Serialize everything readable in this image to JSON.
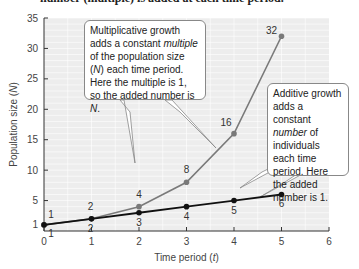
{
  "caption": "number (multiple) is added at each time period.",
  "chart_data": {
    "type": "line",
    "title": "",
    "xlabel": "Time period (t)",
    "ylabel": "Population size (N)",
    "xlim": [
      0,
      6
    ],
    "ylim": [
      0,
      35
    ],
    "x_ticks": [
      0,
      1,
      2,
      3,
      4,
      5,
      6
    ],
    "y_ticks": [
      1,
      5,
      10,
      15,
      20,
      25,
      30,
      35
    ],
    "grid": true,
    "series": [
      {
        "name": "Multiplicative growth",
        "color": "#7a7a7a",
        "x": [
          0,
          1,
          2,
          3,
          4,
          5
        ],
        "values": [
          1,
          2,
          4,
          8,
          16,
          32
        ],
        "labels": [
          "1",
          "2",
          "4",
          "8",
          "16",
          "32"
        ]
      },
      {
        "name": "Additive growth",
        "color": "#111111",
        "x": [
          0,
          1,
          2,
          3,
          4,
          5
        ],
        "values": [
          1,
          2,
          3,
          4,
          5,
          6
        ],
        "labels": [
          "1",
          "2",
          "3",
          "4",
          "5",
          "6"
        ]
      }
    ],
    "annotations": [
      {
        "id": "multiplicative",
        "parts": [
          "Multiplicative growth adds a constant ",
          "multiple",
          " of the population size (",
          "N",
          ") each time period. Here the multiple is 1, so the added number is ",
          "N",
          "."
        ]
      },
      {
        "id": "additive",
        "parts": [
          "Additive growth adds a constant ",
          "number",
          " of individuals each time period. Here the added number is 1."
        ]
      }
    ]
  },
  "axis": {
    "xlabel_text": "Time period (",
    "xlabel_var": "t",
    "xlabel_close": ")",
    "ylabel_text": "Population size (",
    "ylabel_var": "N",
    "ylabel_close": ")"
  }
}
